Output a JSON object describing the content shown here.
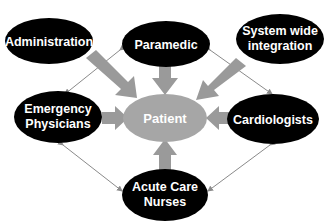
{
  "diagram": {
    "center": {
      "label": "Patient",
      "color": "#a6a6a6"
    },
    "nodes": [
      {
        "id": "administration",
        "lines": [
          "Administration"
        ]
      },
      {
        "id": "paramedic",
        "lines": [
          "Paramedic"
        ]
      },
      {
        "id": "system",
        "lines": [
          "System wide",
          "integration"
        ]
      },
      {
        "id": "emergency",
        "lines": [
          "Emergency",
          "Physicians"
        ]
      },
      {
        "id": "cardiologists",
        "lines": [
          "Cardiologists"
        ]
      },
      {
        "id": "nurses",
        "lines": [
          "Acute Care",
          "Nurses"
        ]
      }
    ],
    "colors": {
      "node_fill": "#000000",
      "node_text": "#ffffff",
      "arrow": "#9a9a9a",
      "connector": "#8a8a8a"
    }
  }
}
